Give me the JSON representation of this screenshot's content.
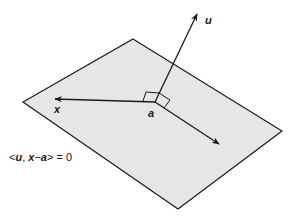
{
  "diagram": {
    "labels": {
      "normal_vector": "u",
      "point_on_plane": "a",
      "plane_vector_tip": "x"
    },
    "equation": {
      "open": "<",
      "u": "u",
      "comma": ", ",
      "x": "x",
      "minus": "−",
      "a": "a",
      "close": ">",
      "rest": " = 0"
    },
    "colors": {
      "plane_fill": "#e6e6e6",
      "stroke": "#1a1a1a",
      "background": "#ffffff"
    }
  }
}
